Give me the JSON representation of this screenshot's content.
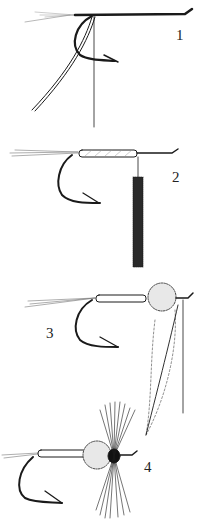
{
  "figure": {
    "background": "#ffffff",
    "ink": "#1a1a1a",
    "steps": [
      {
        "label": "1",
        "content": "thread tied on hook shank with tail fibers and ribbing"
      },
      {
        "label": "2",
        "content": "floss body wrapped, dubbed strand hanging"
      },
      {
        "label": "3",
        "content": "dubbed thorax and hackle feather tied in"
      },
      {
        "label": "4",
        "content": "hackle wound, completed fly"
      }
    ]
  }
}
